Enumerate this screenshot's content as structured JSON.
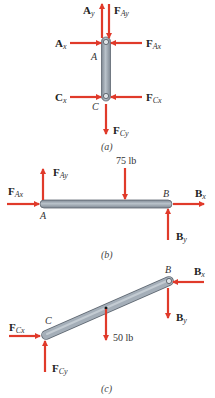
{
  "colors": {
    "arrow": "#e03a2a",
    "member_fill": "#9aa4ae",
    "member_edge": "#5d6670",
    "text": "#222222"
  },
  "figure_a": {
    "caption": "(a)",
    "points": {
      "A": "A",
      "C": "C"
    },
    "forces": {
      "Ay": {
        "main": "A",
        "sub": "y"
      },
      "FAy": {
        "main": "F",
        "sub": "Ay"
      },
      "Ax": {
        "main": "A",
        "sub": "x"
      },
      "FAx": {
        "main": "F",
        "sub": "Ax"
      },
      "Cx": {
        "main": "C",
        "sub": "x"
      },
      "FCx": {
        "main": "F",
        "sub": "Cx"
      },
      "FCy": {
        "main": "F",
        "sub": "Cy"
      }
    }
  },
  "figure_b": {
    "caption": "(b)",
    "points": {
      "A": "A",
      "B": "B"
    },
    "load": "75 lb",
    "forces": {
      "FAx": {
        "main": "F",
        "sub": "Ax"
      },
      "FAy": {
        "main": "F",
        "sub": "Ay"
      },
      "Bx": {
        "main": "B",
        "sub": "x"
      },
      "By": {
        "main": "B",
        "sub": "y"
      }
    }
  },
  "figure_c": {
    "caption": "(c)",
    "points": {
      "B": "B",
      "C": "C"
    },
    "load": "50 lb",
    "forces": {
      "Bx": {
        "main": "B",
        "sub": "x"
      },
      "By": {
        "main": "B",
        "sub": "y"
      },
      "FCx": {
        "main": "F",
        "sub": "Cx"
      },
      "FCy": {
        "main": "F",
        "sub": "Cy"
      }
    }
  }
}
